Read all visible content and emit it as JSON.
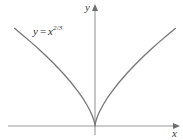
{
  "figure": {
    "name": "cusp-graph-x-to-the-two-thirds",
    "background_color": "#ffffff",
    "width": 183,
    "height": 140
  },
  "labels": {
    "y_axis": "y",
    "x_axis": "x",
    "equation": {
      "lhs": "y",
      "relation": "=",
      "base": "x",
      "exponent_numerator": "2",
      "exponent_slash": "/",
      "exponent_denominator": "3",
      "plain": "y = x^(2/3)"
    }
  },
  "colors": {
    "curve": "#777777",
    "axis": "#9a9a9a",
    "arrow": "#6e6e6e",
    "text": "#2e2e2e"
  },
  "chart_data": {
    "type": "line",
    "title": "",
    "subtitle": "",
    "xlabel": "x",
    "ylabel": "y",
    "grid": false,
    "legend": false,
    "annotations": [
      {
        "text": "y = x^(2/3)",
        "x": -6.6,
        "y": 3.5,
        "description": "equation label placed above the left branch of the curve"
      }
    ],
    "axes": {
      "origin_px": {
        "x": 95,
        "y": 126
      },
      "x_axis_y_px": 126,
      "y_axis_x_px": 95,
      "x_axis_arrow_px": {
        "x": 177,
        "y": 126
      },
      "y_axis_arrow_px": {
        "x": 95,
        "y": 6
      },
      "xlim": [
        -10.5,
        10.5
      ],
      "ylim": [
        -0.6,
        5.2
      ]
    },
    "series": [
      {
        "name": "y = x^(2/3)",
        "equation": "y = x^(2/3)",
        "color": "#777777",
        "x": [
          -10,
          -9,
          -8,
          -7,
          -6,
          -5,
          -4,
          -3,
          -2,
          -1.5,
          -1,
          -0.6,
          -0.3,
          -0.12,
          -0.04,
          0,
          0.04,
          0.12,
          0.3,
          0.6,
          1,
          1.5,
          2,
          3,
          4,
          5,
          6,
          7,
          8,
          9,
          10
        ],
        "y": [
          4.642,
          4.327,
          4.0,
          3.659,
          3.302,
          2.924,
          2.52,
          2.08,
          1.587,
          1.31,
          1.0,
          0.711,
          0.448,
          0.245,
          0.117,
          0,
          0.117,
          0.245,
          0.448,
          0.711,
          1.0,
          1.31,
          1.587,
          2.08,
          2.52,
          2.924,
          3.302,
          3.659,
          4.0,
          4.327,
          4.642
        ]
      }
    ]
  }
}
